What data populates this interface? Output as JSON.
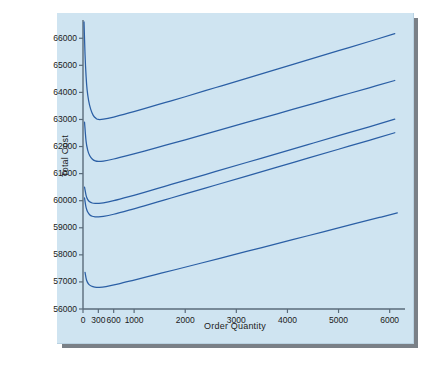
{
  "panel": {
    "background_color": "#cfe4f1",
    "shadow_color": "#7a8087"
  },
  "chart_data": {
    "type": "line",
    "title": "",
    "xlabel": "Order Quantity",
    "ylabel": "Total Cost",
    "xlim": [
      0,
      6300
    ],
    "ylim": [
      56000,
      66600
    ],
    "grid": false,
    "legend": "none",
    "axis_color": "#5a6b7a",
    "line_color": "#2b5fa5",
    "xticks": [
      0,
      300,
      600,
      1000,
      2000,
      3000,
      4000,
      5000,
      6000
    ],
    "xtick_labels": [
      "0",
      "300",
      "600",
      "1000",
      "2000",
      "3000",
      "4000",
      "5000",
      "6000"
    ],
    "yticks": [
      56000,
      57000,
      58000,
      59000,
      60000,
      61000,
      62000,
      63000,
      64000,
      65000,
      66000
    ],
    "ytick_labels": [
      "56000",
      "57000",
      "58000",
      "59000",
      "60000",
      "61000",
      "62000",
      "63000",
      "64000",
      "65000",
      "66000"
    ],
    "series": [
      {
        "name": "curve-1",
        "minimum_x": 300,
        "minimum_y": 63000,
        "points": [
          [
            20,
            66600
          ],
          [
            40,
            65400
          ],
          [
            60,
            64600
          ],
          [
            80,
            64100
          ],
          [
            110,
            63700
          ],
          [
            150,
            63380
          ],
          [
            200,
            63150
          ],
          [
            260,
            63030
          ],
          [
            300,
            63000
          ],
          [
            400,
            63010
          ],
          [
            600,
            63090
          ],
          [
            900,
            63240
          ],
          [
            1200,
            63400
          ],
          [
            1600,
            63620
          ],
          [
            2000,
            63840
          ],
          [
            2600,
            64180
          ],
          [
            3200,
            64520
          ],
          [
            3800,
            64860
          ],
          [
            4400,
            65200
          ],
          [
            5000,
            65540
          ],
          [
            5600,
            65880
          ],
          [
            6100,
            66170
          ]
        ]
      },
      {
        "name": "curve-2",
        "minimum_x": 300,
        "minimum_y": 61450,
        "points": [
          [
            30,
            62900
          ],
          [
            60,
            62200
          ],
          [
            90,
            61880
          ],
          [
            130,
            61670
          ],
          [
            180,
            61540
          ],
          [
            240,
            61470
          ],
          [
            300,
            61450
          ],
          [
            400,
            61465
          ],
          [
            600,
            61540
          ],
          [
            900,
            61680
          ],
          [
            1200,
            61830
          ],
          [
            1600,
            62040
          ],
          [
            2000,
            62250
          ],
          [
            2600,
            62570
          ],
          [
            3200,
            62890
          ],
          [
            3800,
            63210
          ],
          [
            4400,
            63530
          ],
          [
            5000,
            63850
          ],
          [
            5600,
            64170
          ],
          [
            6100,
            64440
          ]
        ]
      },
      {
        "name": "curve-3",
        "minimum_x": 300,
        "minimum_y": 59900,
        "points": [
          [
            30,
            60500
          ],
          [
            60,
            60200
          ],
          [
            90,
            60050
          ],
          [
            130,
            59960
          ],
          [
            180,
            59915
          ],
          [
            240,
            59900
          ],
          [
            300,
            59900
          ],
          [
            400,
            59920
          ],
          [
            600,
            60000
          ],
          [
            900,
            60150
          ],
          [
            1200,
            60310
          ],
          [
            1600,
            60530
          ],
          [
            2000,
            60750
          ],
          [
            2600,
            61080
          ],
          [
            3200,
            61410
          ],
          [
            3800,
            61740
          ],
          [
            4400,
            62070
          ],
          [
            5000,
            62400
          ],
          [
            5600,
            62730
          ],
          [
            6100,
            63010
          ]
        ]
      },
      {
        "name": "curve-4",
        "minimum_x": 300,
        "minimum_y": 59400,
        "points": [
          [
            30,
            60100
          ],
          [
            60,
            59750
          ],
          [
            90,
            59590
          ],
          [
            130,
            59480
          ],
          [
            180,
            59425
          ],
          [
            240,
            59405
          ],
          [
            300,
            59400
          ],
          [
            400,
            59420
          ],
          [
            600,
            59500
          ],
          [
            900,
            59650
          ],
          [
            1200,
            59810
          ],
          [
            1600,
            60030
          ],
          [
            2000,
            60250
          ],
          [
            2600,
            60580
          ],
          [
            3200,
            60910
          ],
          [
            3800,
            61240
          ],
          [
            4400,
            61570
          ],
          [
            5000,
            61900
          ],
          [
            5600,
            62230
          ],
          [
            6100,
            62510
          ]
        ]
      },
      {
        "name": "curve-5",
        "minimum_x": 320,
        "minimum_y": 56800,
        "points": [
          [
            40,
            57350
          ],
          [
            70,
            57060
          ],
          [
            110,
            56920
          ],
          [
            160,
            56850
          ],
          [
            230,
            56810
          ],
          [
            320,
            56800
          ],
          [
            450,
            56830
          ],
          [
            700,
            56930
          ],
          [
            1000,
            57070
          ],
          [
            1400,
            57260
          ],
          [
            1800,
            57450
          ],
          [
            2300,
            57690
          ],
          [
            2900,
            57980
          ],
          [
            3500,
            58270
          ],
          [
            4100,
            58560
          ],
          [
            4700,
            58850
          ],
          [
            5300,
            59140
          ],
          [
            5800,
            59380
          ],
          [
            6150,
            59550
          ]
        ]
      }
    ]
  }
}
